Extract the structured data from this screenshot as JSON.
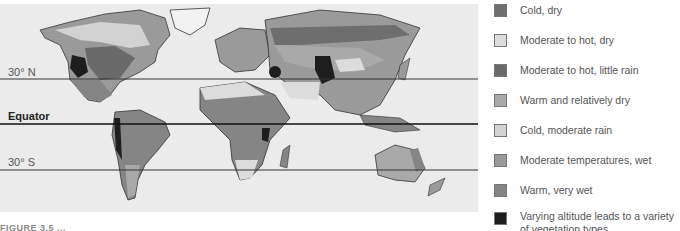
{
  "map": {
    "background": "#ebebeb",
    "latitude_lines": [
      {
        "label": "30° N",
        "y": 79,
        "bold": false
      },
      {
        "label": "Equator",
        "y": 124,
        "bold": true
      },
      {
        "label": "30° S",
        "y": 170,
        "bold": false
      }
    ]
  },
  "legend": {
    "items": [
      {
        "label": "Cold, dry",
        "color": "#6e6e6e"
      },
      {
        "label": "Moderate to hot, dry",
        "color": "#dcdcdc"
      },
      {
        "label": "Moderate to hot, little rain",
        "color": "#6a6a6a"
      },
      {
        "label": "Warm and relatively dry",
        "color": "#a9a9a9"
      },
      {
        "label": "Cold, moderate rain",
        "color": "#d2d2d2"
      },
      {
        "label": "Moderate temperatures, wet",
        "color": "#9a9a9a"
      },
      {
        "label": "Warm, very wet",
        "color": "#858585"
      },
      {
        "label": "Varying altitude leads to a variety of vegetation types",
        "color": "#1e1e1e"
      }
    ]
  },
  "caption": "FIGURE 3.5 ..."
}
